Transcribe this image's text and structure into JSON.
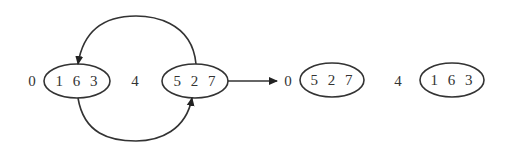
{
  "diagram": {
    "left_state": {
      "index0_label": "0",
      "node_a": "1 6 3",
      "index4_label": "4",
      "node_b": "5 2 7"
    },
    "right_state": {
      "index0_label": "0",
      "node_a": "5 2 7",
      "index4_label": "4",
      "node_b": "1 6 3"
    },
    "edges": [
      {
        "from": "5 2 7",
        "to": "1 6 3",
        "style": "arc-top"
      },
      {
        "from": "1 6 3",
        "to": "5 2 7",
        "style": "arc-bottom"
      },
      {
        "from": "left_state",
        "to": "right_state",
        "style": "straight-arrow"
      }
    ],
    "colors": {
      "stroke": "#333333",
      "background": "#ffffff"
    }
  }
}
